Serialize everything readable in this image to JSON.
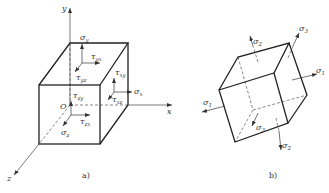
{
  "figure_a": {
    "caption": "a)",
    "axes": {
      "x": "x",
      "y": "y",
      "z": "z",
      "origin": "O"
    },
    "stresses": {
      "sigma_y": {
        "sym": "σ",
        "sub": "y"
      },
      "tau_yx": {
        "sym": "τ",
        "sub": "yx"
      },
      "tau_yz": {
        "sym": "τ",
        "sub": "yz"
      },
      "tau_xy": {
        "sym": "τ",
        "sub": "xy"
      },
      "sigma_x": {
        "sym": "σ",
        "sub": "x"
      },
      "tau_xz": {
        "sym": "τ",
        "sub": "xz"
      },
      "tau_zy": {
        "sym": "τ",
        "sub": "zy"
      },
      "tau_zx": {
        "sym": "τ",
        "sub": "zx"
      },
      "sigma_z": {
        "sym": "σ",
        "sub": "z"
      }
    }
  },
  "figure_b": {
    "caption": "b)",
    "stresses": {
      "sigma_2_top": {
        "sym": "σ",
        "sub": "2"
      },
      "sigma_3_top": {
        "sym": "σ",
        "sub": "3"
      },
      "sigma_1_right": {
        "sym": "σ",
        "sub": "1"
      },
      "sigma_1_left": {
        "sym": "σ",
        "sub": "1"
      },
      "sigma_3_bottom": {
        "sym": "σ",
        "sub": "3"
      },
      "sigma_2_bottom": {
        "sym": "σ",
        "sub": "2"
      }
    }
  },
  "colors": {
    "line": "#222222",
    "text": "#333333",
    "background": "#ffffff"
  }
}
